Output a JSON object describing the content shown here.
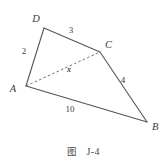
{
  "figure": {
    "caption_label": "图",
    "caption_id": "J-4",
    "stroke_color": "#555555",
    "dashed_color": "#666666",
    "text_color": "#3a3a3a",
    "background": "#ffffff"
  },
  "diagram": {
    "type": "geometry-quadrilateral",
    "vertices": [
      {
        "name": "D",
        "label": "D",
        "x": 44,
        "y": 28,
        "label_x": 36,
        "label_y": 22
      },
      {
        "name": "C",
        "label": "C",
        "x": 100,
        "y": 52,
        "label_x": 105,
        "label_y": 48
      },
      {
        "name": "A",
        "label": "A",
        "x": 26,
        "y": 86,
        "label_x": 13,
        "label_y": 92
      },
      {
        "name": "B",
        "label": "B",
        "x": 147,
        "y": 122,
        "label_x": 152,
        "label_y": 130
      }
    ],
    "edges": [
      {
        "name": "edge-AD",
        "from": "A",
        "to": "D",
        "style": "solid",
        "label": "2",
        "label_x": 24,
        "label_y": 54
      },
      {
        "name": "edge-DC",
        "from": "D",
        "to": "C",
        "style": "solid",
        "label": "3",
        "label_x": 71,
        "label_y": 33
      },
      {
        "name": "edge-CB",
        "from": "C",
        "to": "B",
        "style": "solid",
        "label": "4",
        "label_x": 123,
        "label_y": 83
      },
      {
        "name": "edge-AB",
        "from": "A",
        "to": "B",
        "style": "solid",
        "label": "10",
        "label_x": 70,
        "label_y": 112
      },
      {
        "name": "diagonal-AC",
        "from": "A",
        "to": "C",
        "style": "dashed",
        "label": "x",
        "label_x": 69,
        "label_y": 72
      }
    ]
  }
}
